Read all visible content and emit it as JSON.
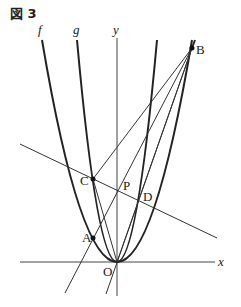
{
  "figure": {
    "title": "図 3",
    "labels": {
      "f": "f",
      "g": "g",
      "y_axis": "y",
      "x_axis": "x",
      "origin": "O",
      "A": "A",
      "B": "B",
      "C": "C",
      "D": "D",
      "P": "P"
    },
    "colors": {
      "ink": "#222222",
      "background": "#ffffff"
    }
  }
}
